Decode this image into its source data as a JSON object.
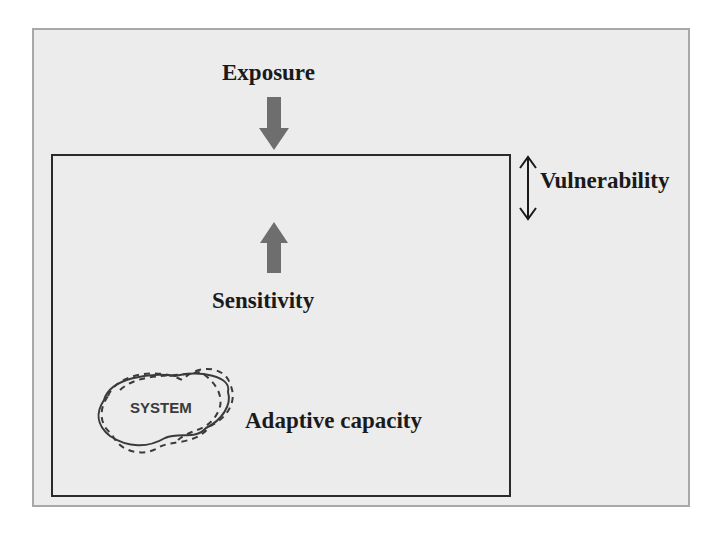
{
  "diagram": {
    "labels": {
      "exposure": "Exposure",
      "sensitivity": "Sensitivity",
      "adaptive_capacity": "Adaptive capacity",
      "vulnerability": "Vulnerability",
      "system": "SYSTEM"
    },
    "arrows": [
      {
        "name": "exposure-arrow",
        "direction": "down",
        "color": "#6e6e6e"
      },
      {
        "name": "sensitivity-arrow",
        "direction": "up",
        "color": "#6e6e6e"
      },
      {
        "name": "vulnerability-arrow",
        "direction": "double-vertical",
        "color": "#1a1a1a"
      }
    ],
    "colors": {
      "background": "#ececec",
      "frame_border": "#a8a8a8",
      "box_border": "#2a2a2a",
      "text": "#1a1a1a"
    }
  }
}
